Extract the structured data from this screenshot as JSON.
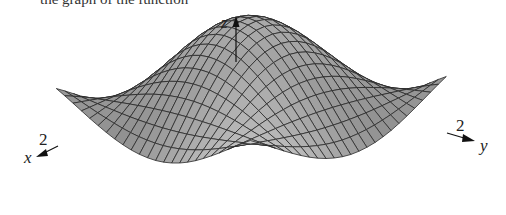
{
  "caption_fragment": "the graph of the function",
  "chart_data": {
    "type": "surface3d",
    "title": "",
    "function": "z = cos(x) * cos(y)",
    "x_range": [
      -2,
      2
    ],
    "y_range": [
      -2,
      2
    ],
    "mesh_divisions": 24,
    "axes": {
      "x": {
        "label": "x",
        "tick_label": "2"
      },
      "y": {
        "label": "y",
        "tick_label": "2"
      },
      "z": {
        "label": "z"
      }
    },
    "features": [
      {
        "name": "central peak",
        "x": 0,
        "y": 0,
        "z": 1
      },
      {
        "name": "front saddle hump",
        "description": "lighter shaded bump toward viewer at corner x=2,y=-2 region"
      }
    ],
    "grid": false,
    "legend": null
  },
  "colors": {
    "surface_dark": "#8e8e8e",
    "surface_light": "#f0f0f0",
    "mesh_line": "#2a2a2a",
    "axis": "#111111",
    "background": "#ffffff"
  },
  "labels": {
    "z_axis": "z",
    "x_axis": "x",
    "y_axis": "y",
    "x_tick": "2",
    "y_tick": "2"
  }
}
